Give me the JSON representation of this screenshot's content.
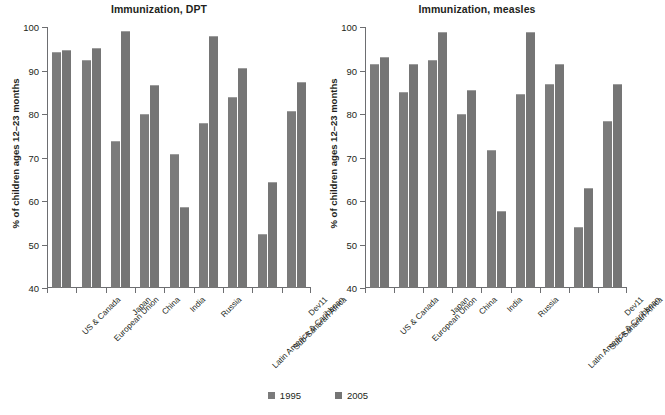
{
  "figure": {
    "ylabel": "% of children ages 12–23 months",
    "legend": [
      {
        "label": "1995",
        "color": "#7b7b7b"
      },
      {
        "label": "2005",
        "color": "#757575"
      }
    ]
  },
  "chart_data": [
    {
      "type": "bar",
      "title": "Immunization, DPT",
      "xlabel": "",
      "ylabel": "% of children ages 12–23 months",
      "ylim": [
        40,
        100
      ],
      "yticks": [
        40,
        50,
        60,
        70,
        80,
        90,
        100
      ],
      "grid": false,
      "legend_position": "bottom-center",
      "categories": [
        "US & Canada",
        "European Union",
        "Japan",
        "China",
        "India",
        "Russia",
        "Latin America & Caribbean",
        "Sub-Saharan Africa",
        "Dev11"
      ],
      "series": [
        {
          "name": "1995",
          "values": [
            94.3,
            92.5,
            73.7,
            79.9,
            70.7,
            77.9,
            83.9,
            52.4,
            80.7
          ]
        },
        {
          "name": "2005",
          "values": [
            94.8,
            95.1,
            99.0,
            86.7,
            58.7,
            97.9,
            90.6,
            64.4,
            87.4
          ]
        }
      ]
    },
    {
      "type": "bar",
      "title": "Immunization, measles",
      "xlabel": "",
      "ylabel": "% of children ages 12–23 months",
      "ylim": [
        40,
        100
      ],
      "yticks": [
        40,
        50,
        60,
        70,
        80,
        90,
        100
      ],
      "grid": false,
      "legend_position": "bottom-center",
      "categories": [
        "US & Canada",
        "European Union",
        "Japan",
        "China",
        "India",
        "Russia",
        "Latin America & Caribbean",
        "Sub-Saharan Africa",
        "Dev11"
      ],
      "series": [
        {
          "name": "1995",
          "values": [
            91.5,
            85.0,
            92.5,
            79.9,
            71.7,
            84.6,
            86.8,
            54.1,
            78.3
          ]
        },
        {
          "name": "2005",
          "values": [
            93.1,
            91.4,
            98.9,
            85.6,
            57.7,
            98.8,
            91.4,
            63.1,
            86.8
          ]
        }
      ]
    }
  ]
}
